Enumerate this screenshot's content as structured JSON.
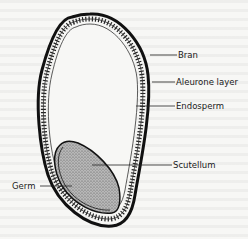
{
  "diagram": {
    "labels": {
      "bran": "Bran",
      "aleurone": "Aleurone layer",
      "endosperm": "Endosperm",
      "scutellum": "Scutellum",
      "germ": "Germ"
    },
    "colors": {
      "outline": "#111111",
      "germ_fill": "#9a9a9a",
      "background": "#f7f7f5"
    }
  }
}
